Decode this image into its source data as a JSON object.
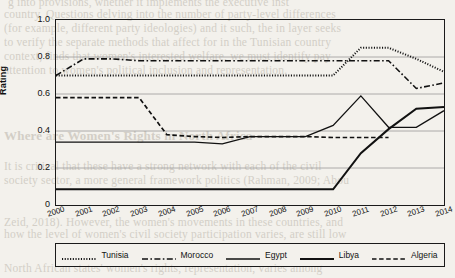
{
  "chart_data": {
    "type": "line",
    "title": "",
    "xlabel": "",
    "ylabel": "Rating",
    "ylim": [
      0,
      1.0
    ],
    "yticks": [
      0,
      0.2,
      0.4,
      0.6,
      0.8,
      1.0
    ],
    "ytick_labels": [
      "0",
      "0.2",
      "0.4",
      "0.6",
      "0.8",
      "1.0"
    ],
    "grid": "horizontal",
    "legend_position": "bottom",
    "x": [
      2000,
      2001,
      2002,
      2003,
      2004,
      2005,
      2006,
      2007,
      2008,
      2009,
      2010,
      2011,
      2012,
      2013,
      2014
    ],
    "categories": [
      "2000",
      "2001",
      "2002",
      "2003",
      "2004",
      "2005",
      "2006",
      "2007",
      "2008",
      "2009",
      "2010",
      "2011",
      "2012",
      "2013",
      "2014"
    ],
    "series": [
      {
        "name": "Tunisia",
        "style": "dotted",
        "color": "#111111",
        "values": [
          0.7,
          0.7,
          0.7,
          0.7,
          0.7,
          0.7,
          0.7,
          0.7,
          0.7,
          0.7,
          0.7,
          0.85,
          0.85,
          0.79,
          0.72
        ]
      },
      {
        "name": "Morocco",
        "style": "dash-dot",
        "color": "#111111",
        "values": [
          0.7,
          0.79,
          0.79,
          0.78,
          0.78,
          0.78,
          0.78,
          0.78,
          0.78,
          0.78,
          0.78,
          0.78,
          0.78,
          0.63,
          0.66
        ]
      },
      {
        "name": "Egypt",
        "style": "solid-thin",
        "color": "#111111",
        "values": [
          0.34,
          0.34,
          0.34,
          0.34,
          0.34,
          0.34,
          0.33,
          0.37,
          0.37,
          0.37,
          0.43,
          0.59,
          0.42,
          0.42,
          0.51
        ]
      },
      {
        "name": "Libya",
        "style": "solid-thick",
        "color": "#111111",
        "values": [
          0.085,
          0.085,
          0.085,
          0.085,
          0.085,
          0.085,
          0.085,
          0.085,
          0.085,
          0.085,
          0.085,
          0.28,
          0.41,
          0.52,
          0.53
        ]
      },
      {
        "name": "Algeria",
        "style": "dashed",
        "color": "#111111",
        "values": [
          0.58,
          0.58,
          0.58,
          0.58,
          0.38,
          0.37,
          0.365,
          0.37,
          0.37,
          0.37,
          0.365,
          0.365,
          0.365,
          null,
          null
        ]
      }
    ]
  },
  "legend": {
    "items": [
      {
        "label": "Tunisia"
      },
      {
        "label": "Morocco"
      },
      {
        "label": "Egypt"
      },
      {
        "label": "Libya"
      },
      {
        "label": "Algeria"
      }
    ]
  },
  "background_text": {
    "lines": [
      "g into provisions, whether it implements the executive inst",
      "country. Questions delving into the number of party-level differences",
      "(for example, different party ideologies) and it such, the in layer seeks",
      "to verify the separate methods that affect for in the Tunisian country",
      "context, finds that women's interested welfare, we must identify pay",
      "attention to women's political inclusion and representation."
    ],
    "heading": "Where are Women's Rights in North Africa",
    "lines2": [
      "It is critical that these have a strong network with each of the civil",
      "society sector, a more general framework politics (Rahman, 2009; Abou",
      "Zeid, 2018). However, the women's movements in these countries, and",
      "how the level of women's civil society participation varies, are still low",
      "North African states' women's rights, representation, varies among"
    ]
  }
}
